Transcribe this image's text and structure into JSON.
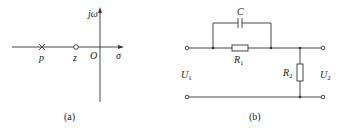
{
  "figure_a": {
    "caption": "(a)",
    "axes": {
      "vertical_label": "jω",
      "horizontal_label": "σ",
      "origin_label": "O"
    },
    "points": [
      {
        "type": "pole",
        "symbol": "×",
        "label": "p"
      },
      {
        "type": "zero",
        "symbol": "o",
        "label": "z"
      }
    ]
  },
  "figure_b": {
    "caption": "(b)",
    "components": {
      "capacitor": "C",
      "resistor_1": {
        "base": "R",
        "sub": "1"
      },
      "resistor_2": {
        "base": "R",
        "sub": "2"
      }
    },
    "ports": {
      "input": {
        "base": "U",
        "sub": "1"
      },
      "output": {
        "base": "U",
        "sub": "2"
      }
    }
  },
  "colors": {
    "line": "#333333",
    "background": "#ffffff"
  }
}
